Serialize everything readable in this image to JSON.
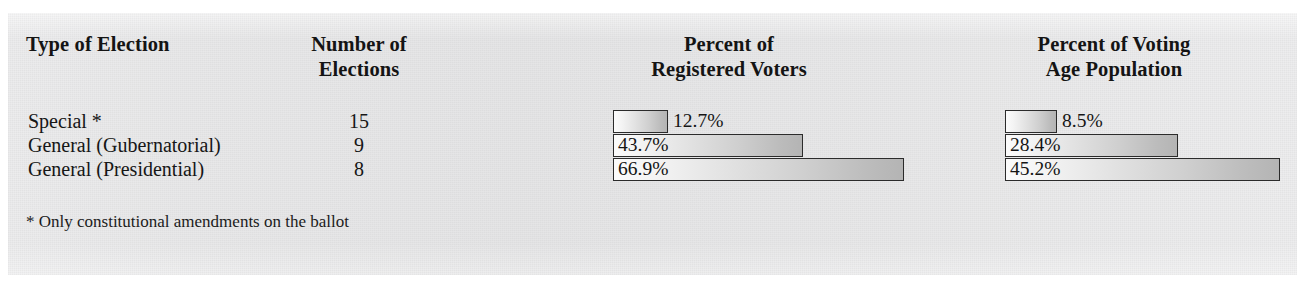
{
  "figure": {
    "background_color": "#ffffff",
    "panel_color": "#e8e8e9"
  },
  "headers": {
    "type_of_election": "Type of Election",
    "number_of_elections": "Number of\nElections",
    "percent_registered_voters": "Percent of\nRegistered Voters",
    "percent_voting_age_population": "Percent of Voting\nAge Population"
  },
  "rows": [
    {
      "label": "Special *",
      "count": "15",
      "registered": "12.7%",
      "voting_age": "8.5%"
    },
    {
      "label": "General (Gubernatorial)",
      "count": "9",
      "registered": "43.7%",
      "voting_age": "28.4%"
    },
    {
      "label": "General (Presidential)",
      "count": "8",
      "registered": "66.9%",
      "voting_age": "45.2%"
    }
  ],
  "footnote": "* Only constitutional amendments on the ballot",
  "chart_data": {
    "type": "bar",
    "orientation": "horizontal",
    "title": "",
    "categories": [
      "Special *",
      "General (Gubernatorial)",
      "General (Presidential)"
    ],
    "series": [
      {
        "name": "Percent of Registered Voters",
        "values": [
          12.7,
          43.7,
          66.9
        ],
        "labels": [
          "12.7%",
          "43.7%",
          "66.9%"
        ],
        "unit": "%"
      },
      {
        "name": "Percent of Voting Age Population",
        "values": [
          8.5,
          28.4,
          45.2
        ],
        "labels": [
          "8.5%",
          "28.4%",
          "45.2%"
        ],
        "unit": "%"
      }
    ],
    "counts": {
      "name": "Number of Elections",
      "values": [
        15,
        9,
        8
      ]
    },
    "xlabel": "",
    "ylabel": "",
    "xlim": [
      0,
      100
    ],
    "grid": false,
    "legend": "none",
    "bar_fill": "light-to-dark gray gradient",
    "bar_border_color": "#2b2b2b"
  }
}
